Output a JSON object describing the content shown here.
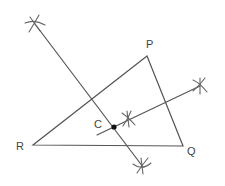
{
  "figure": {
    "stroke_color": "#555555",
    "labels": {
      "P": "P",
      "Q": "Q",
      "R": "R",
      "C": "C"
    },
    "vertices": {
      "P": [
        147,
        56
      ],
      "Q": [
        183,
        146
      ],
      "R": [
        33,
        145
      ]
    },
    "point_C": [
      114,
      127
    ],
    "bisector_1": {
      "from": [
        35,
        24
      ],
      "to": [
        143,
        167
      ]
    },
    "bisector_2": {
      "from": [
        97,
        135
      ],
      "to": [
        200,
        86
      ]
    },
    "arc_marks": [
      [
        35,
        24
      ],
      [
        200,
        86
      ],
      [
        128,
        119
      ],
      [
        142,
        165
      ]
    ]
  }
}
